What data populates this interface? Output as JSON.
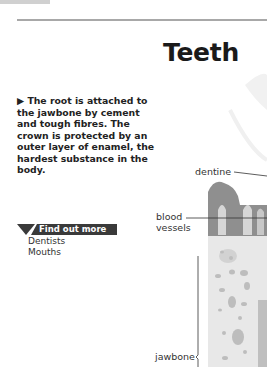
{
  "page": {
    "title": "Teeth",
    "body_text": "▶ The root is attached to the jawbone by cement and tough fibres. The crown is protected by an outer layer of enamel, the hardest substance in the body."
  },
  "find_out_more": {
    "heading": "Find out more",
    "links": [
      "Dentists",
      "Mouths"
    ]
  },
  "diagram": {
    "labels": {
      "dentine": "dentine",
      "blood_vessels_1": "blood",
      "blood_vessels_2": "vessels",
      "jawbone": "jawbone"
    }
  }
}
